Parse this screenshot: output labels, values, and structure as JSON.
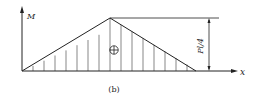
{
  "diagram": {
    "type": "bending-moment-diagram",
    "y_axis_label": "M",
    "x_axis_label": "x",
    "peak_label": "Pl/4",
    "sign_symbol": "⊕",
    "caption": "(b)",
    "line_color": "#222222",
    "hatch_color": "#555555"
  }
}
